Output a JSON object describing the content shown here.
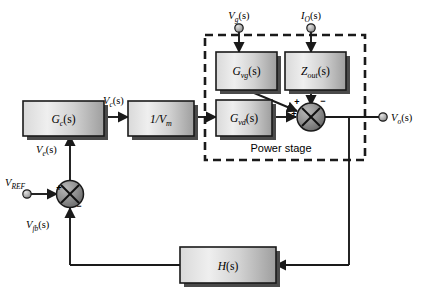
{
  "diagram": {
    "type": "control-block-diagram",
    "colors": {
      "line": "#1a1a1a",
      "block_fill_light": "#e8e8e8",
      "block_fill_dark": "#a8a8a8",
      "block_border": "#1a1a1a",
      "shadow": "#4a4a4a",
      "sum_fill": "#8d8d8d",
      "terminal_fill": "#b8b8b8",
      "background": "#ffffff"
    },
    "blocks": [
      {
        "id": "gc",
        "label": "G",
        "sub": "c",
        "suffix": "(s)"
      },
      {
        "id": "invvm",
        "label": "1/V",
        "sub": "m",
        "suffix": ""
      },
      {
        "id": "gvg",
        "label": "G",
        "sub": "vg",
        "suffix": "(s)"
      },
      {
        "id": "zout",
        "label": "Z",
        "sub": "out",
        "suffix": "(s)"
      },
      {
        "id": "gvd",
        "label": "G",
        "sub": "vd",
        "suffix": "(s)"
      },
      {
        "id": "hs",
        "label": "H",
        "sub": "",
        "suffix": "(s)"
      }
    ],
    "signals": [
      {
        "id": "vc",
        "label": "V",
        "sub": "c",
        "suffix": "(s)"
      },
      {
        "id": "ve",
        "label": "V",
        "sub": "e",
        "suffix": "(s)"
      },
      {
        "id": "vfb",
        "label": "V",
        "sub": "fb",
        "suffix": "(s)"
      },
      {
        "id": "vref",
        "label": "V",
        "sub": "REF",
        "suffix": ""
      },
      {
        "id": "vg",
        "label": "V",
        "sub": "g",
        "suffix": "(s)"
      },
      {
        "id": "io",
        "label": "I",
        "sub": "O",
        "suffix": "(s)"
      },
      {
        "id": "vo",
        "label": "V",
        "sub": "o",
        "suffix": "(s)"
      }
    ],
    "groups": [
      {
        "id": "power_stage",
        "label": "Power stage",
        "style": "dashed"
      }
    ],
    "summing_junctions": [
      {
        "id": "input_sum",
        "signs": [
          {
            "port": "left",
            "sign": "+"
          },
          {
            "port": "bottom",
            "sign": "−"
          }
        ]
      },
      {
        "id": "output_sum",
        "signs": [
          {
            "port": "upper-left-diagonal",
            "sign": "+"
          },
          {
            "port": "left",
            "sign": "+"
          },
          {
            "port": "top",
            "sign": "−"
          }
        ]
      }
    ],
    "terminals": [
      {
        "id": "vref_terminal",
        "name": "V_REF input terminal"
      },
      {
        "id": "vg_terminal",
        "name": "V_g(s) input terminal"
      },
      {
        "id": "io_terminal",
        "name": "I_O(s) input terminal"
      },
      {
        "id": "vo_terminal",
        "name": "V_o(s) output terminal"
      }
    ]
  }
}
